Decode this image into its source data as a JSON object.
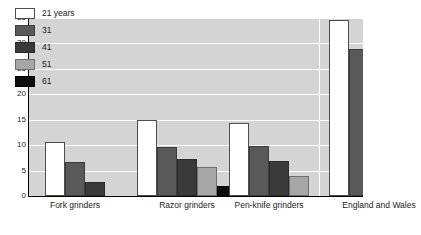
{
  "chart_data": {
    "type": "bar",
    "title": "",
    "subtitle": "",
    "xlabel": "",
    "ylabel": "",
    "ylim": [
      0,
      35
    ],
    "yticks": [
      0,
      5,
      10,
      15,
      20,
      25,
      30,
      35
    ],
    "ytick_labels": [
      "0",
      "5",
      "10",
      "15",
      "20",
      "25",
      "30",
      "35"
    ],
    "grid": true,
    "legend_position": "top-left-inside",
    "categories": [
      "Fork grinders",
      "Razor grinders",
      "Pen-knife grinders",
      "England and Wales"
    ],
    "series": [
      {
        "name": "21 years",
        "color": "#ffffff",
        "values": [
          10.6,
          15.0,
          14.3,
          34.6
        ]
      },
      {
        "name": "31",
        "color": "#595959",
        "values": [
          6.6,
          9.6,
          9.9,
          29.0
        ]
      },
      {
        "name": "41",
        "color": "#3a3a3a",
        "values": [
          2.8,
          7.3,
          6.8,
          24.5
        ]
      },
      {
        "name": "51",
        "color": "#a6a6a6",
        "values": [
          null,
          5.7,
          4.0,
          18.4
        ]
      },
      {
        "name": "61",
        "color": "#0d0d0d",
        "values": [
          null,
          2.0,
          null,
          13.7
        ]
      }
    ],
    "plot_background": "#d4d4d4",
    "gridline_color": "#ffffff",
    "axis_color": "#000000"
  },
  "legend": {
    "items": [
      {
        "label": "21 years",
        "swatch": "series-0-swatch"
      },
      {
        "label": "31",
        "swatch": "series-1-swatch"
      },
      {
        "label": "41",
        "swatch": "series-2-swatch"
      },
      {
        "label": "51",
        "swatch": "series-3-swatch"
      },
      {
        "label": "61",
        "swatch": "series-4-swatch"
      }
    ]
  }
}
